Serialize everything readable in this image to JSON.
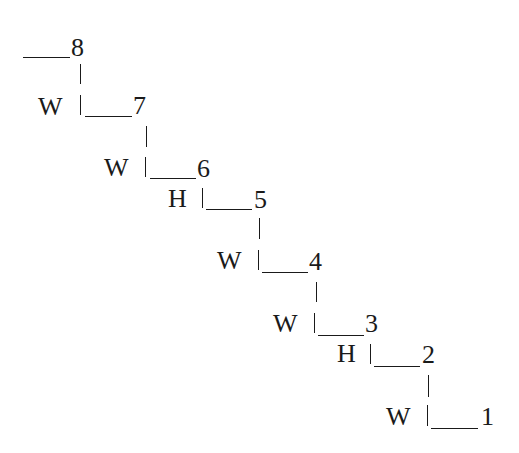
{
  "diagram": {
    "type": "staircase",
    "steps": [
      {
        "number": "8",
        "riser_label": "W"
      },
      {
        "number": "7",
        "riser_label": "W"
      },
      {
        "number": "6",
        "riser_label": "H"
      },
      {
        "number": "5",
        "riser_label": "W"
      },
      {
        "number": "4",
        "riser_label": "W"
      },
      {
        "number": "3",
        "riser_label": "H"
      },
      {
        "number": "2",
        "riser_label": "W"
      },
      {
        "number": "1",
        "riser_label": ""
      }
    ],
    "colors": {
      "ink": "#1a1a1a",
      "background": "#ffffff"
    }
  }
}
